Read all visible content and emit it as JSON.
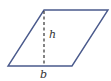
{
  "diagram": {
    "shape": "parallelogram",
    "colors": {
      "outline": "#4a5a8c",
      "height_line": "#333333",
      "label": "#333333"
    },
    "labels": {
      "height": "h",
      "base": "b"
    }
  }
}
